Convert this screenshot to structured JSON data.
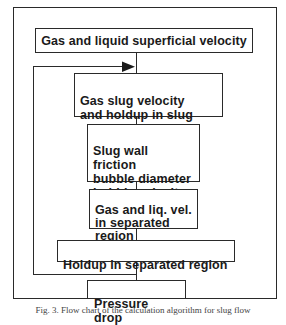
{
  "diagram": {
    "type": "flowchart",
    "nodes": [
      {
        "id": "n1",
        "label": "Gas and liquid superficial velocity"
      },
      {
        "id": "n2",
        "label": "Gas slug velocity\nand holdup in slug"
      },
      {
        "id": "n3",
        "label": "Slug wall friction\nbubble diameter\nbubble velocity"
      },
      {
        "id": "n4",
        "label": "Gas and liq. vel.\nin separated\nregion"
      },
      {
        "id": "n5",
        "label": "Holdup in separated region"
      },
      {
        "id": "n6",
        "label": "Pressure drop"
      }
    ],
    "edges": [
      {
        "from": "n1",
        "to": "n2"
      },
      {
        "from": "n2",
        "to": "n3"
      },
      {
        "from": "n3",
        "to": "n4"
      },
      {
        "from": "n4",
        "to": "n5"
      },
      {
        "from": "n5",
        "to": "n6"
      },
      {
        "from": "n5",
        "to": "n2",
        "type": "feedback-loop"
      }
    ],
    "caption": "Fig. 3. Flow chart of the calculation algorithm for slug flow"
  },
  "colors": {
    "stroke": "#2a2a2a",
    "background": "#ffffff",
    "text": "#1a1a1a"
  }
}
